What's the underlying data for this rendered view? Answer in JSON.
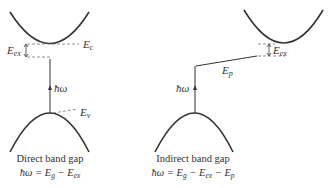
{
  "diagram": {
    "colors": {
      "line": "#333333",
      "dashed": "#777777",
      "background": "#ffffff"
    },
    "direct": {
      "title": "Direct band gap",
      "equation": "ħω = E",
      "eq_parts": [
        "ħω = E",
        "g",
        " − E",
        "ex"
      ],
      "labels": {
        "Ec": "E",
        "Ec_sub": "c",
        "Eex": "E",
        "Eex_sub": "ex",
        "Ev": "E",
        "Ev_sub": "v",
        "photon": "ħω"
      }
    },
    "indirect": {
      "title": "Indirect band gap",
      "eq_parts": [
        "ħω = E",
        "g",
        " − E",
        "ex",
        " − E",
        "p"
      ],
      "labels": {
        "Eex": "E",
        "Eex_sub": "ex",
        "Ep": "E",
        "Ep_sub": "p",
        "photon": "ħω"
      }
    }
  }
}
